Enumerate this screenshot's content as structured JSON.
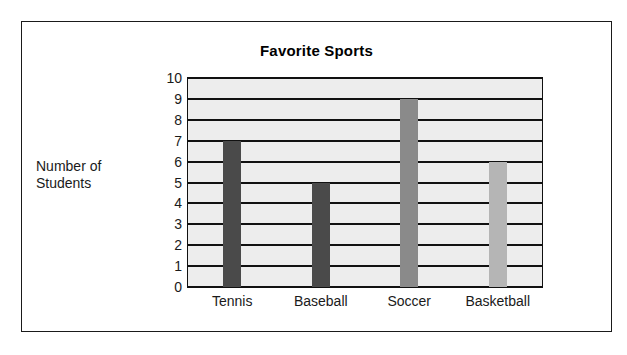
{
  "chart_data": {
    "type": "bar",
    "title": "Favorite Sports",
    "xlabel": "",
    "ylabel": "Number of Students",
    "categories": [
      "Tennis",
      "Baseball",
      "Soccer",
      "Basketball"
    ],
    "values": [
      7,
      5,
      9,
      6
    ],
    "bar_colors": [
      "#4a4a4a",
      "#4a4a4a",
      "#8a8a8a",
      "#b5b5b5"
    ],
    "ylim": [
      0,
      10
    ],
    "ytick_labels": [
      "10",
      "9",
      "8",
      "7",
      "6",
      "5",
      "4",
      "3",
      "2",
      "1",
      "0"
    ],
    "ytick_values": [
      10,
      9,
      8,
      7,
      6,
      5,
      4,
      3,
      2,
      1,
      0
    ],
    "grid": true,
    "legend": "none",
    "plot_background": "#ededed",
    "gridline_color": "#111111",
    "frame_color": "#1a1a1a"
  }
}
